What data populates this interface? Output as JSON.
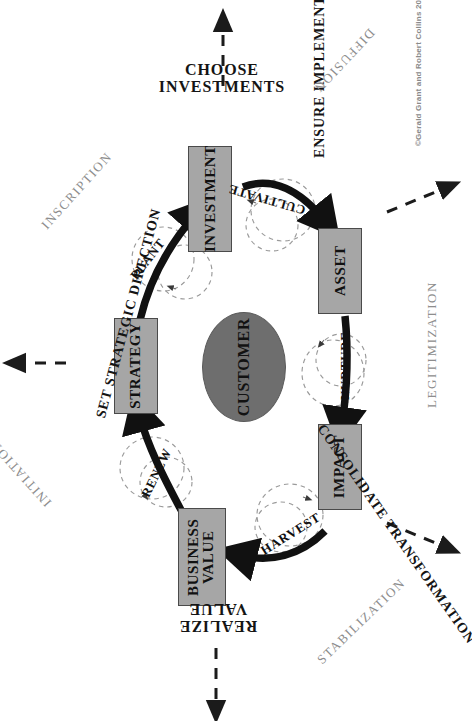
{
  "diagram": {
    "copyright": "©Gerald Grant and Robert Collins 2012",
    "center": {
      "label": "CUSTOMER",
      "color": "#6e6e6e"
    },
    "box_color": "#a6a6a6",
    "box_border": "#4a4a4a"
  },
  "boxes": [
    {
      "id": "investment",
      "label": "INVESTMENT"
    },
    {
      "id": "asset",
      "label": "ASSET"
    },
    {
      "id": "impact",
      "label": "IMPACT"
    },
    {
      "id": "business-value",
      "label": "BUSINESS\nVALUE"
    },
    {
      "id": "strategy",
      "label": "STRATEGY"
    }
  ],
  "phases": [
    {
      "id": "choose-investments",
      "label": "CHOOSE\nINVESTMENTS"
    },
    {
      "id": "ensure-implementation",
      "label": "ENSURE IMPLEMENTATION"
    },
    {
      "id": "consolidate-transformation",
      "label": "CONSOLIDATE TRANSFORMATION"
    },
    {
      "id": "realize-value",
      "label": "REALIZE\nVALUE"
    },
    {
      "id": "set-strategic-direction",
      "label": "SET STRATEGIC DIRECTION"
    }
  ],
  "loops": [
    {
      "id": "plant",
      "label": "PLANT"
    },
    {
      "id": "cultivate",
      "label": "CULTIVATE"
    },
    {
      "id": "nurture",
      "label": "NURTURE"
    },
    {
      "id": "harvest",
      "label": "HARVEST"
    },
    {
      "id": "renew",
      "label": "RENEW"
    }
  ],
  "stages": [
    {
      "id": "diffusion",
      "label": "DIFFUSION"
    },
    {
      "id": "inscription",
      "label": "INSCRIPTION"
    },
    {
      "id": "legitimization",
      "label": "LEGITIMIZATION"
    },
    {
      "id": "initiation",
      "label": "INITIATION"
    },
    {
      "id": "stabilization",
      "label": "STABILIZATION"
    }
  ]
}
